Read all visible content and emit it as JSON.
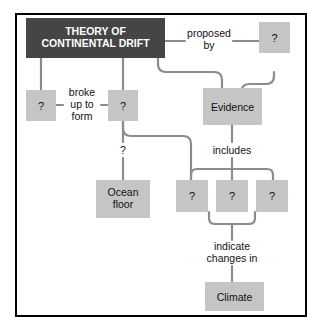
{
  "diagram": {
    "type": "concept-map",
    "title": "THEORY OF CONTINENTAL DRIFT",
    "colors": {
      "title_box_fill": "#454545",
      "title_box_text": "#ffffff",
      "node_fill": "#c5c5c5",
      "connector": "#8c8c8c",
      "frame_border": "#000000",
      "background": "#ffffff"
    },
    "nodes": [
      {
        "id": "theory",
        "label": "THEORY OF\nCONTINENTAL DRIFT",
        "line1": "THEORY OF",
        "line2": "CONTINENTAL DRIFT",
        "style": "title"
      },
      {
        "id": "proposer",
        "label": "?",
        "style": "blank"
      },
      {
        "id": "evidence",
        "label": "Evidence",
        "style": "filled"
      },
      {
        "id": "blank1",
        "label": "?",
        "style": "blank"
      },
      {
        "id": "blank2",
        "label": "?",
        "style": "blank"
      },
      {
        "id": "ocean",
        "label": "Ocean\nfloor",
        "line1": "Ocean",
        "line2": "floor",
        "style": "filled"
      },
      {
        "id": "ev1",
        "label": "?",
        "style": "blank"
      },
      {
        "id": "ev2",
        "label": "?",
        "style": "blank"
      },
      {
        "id": "ev3",
        "label": "?",
        "style": "blank"
      },
      {
        "id": "climate",
        "label": "Climate",
        "style": "filled"
      }
    ],
    "links": [
      {
        "id": "proposed-by",
        "from": "theory",
        "to": "proposer",
        "line1": "proposed",
        "line2": "by"
      },
      {
        "id": "broke-up-to-form",
        "from": "blank1",
        "to": "blank2",
        "line1": "broke",
        "line2": "up to",
        "line3": "form"
      },
      {
        "id": "ocean-link",
        "from": "blank2",
        "to": "ocean",
        "line1": "?"
      },
      {
        "id": "includes",
        "from": "evidence",
        "to": "ev2",
        "line1": "includes"
      },
      {
        "id": "indicate-changes",
        "from": "ev2",
        "to": "climate",
        "line1": "indicate",
        "line2": "changes in"
      }
    ]
  }
}
